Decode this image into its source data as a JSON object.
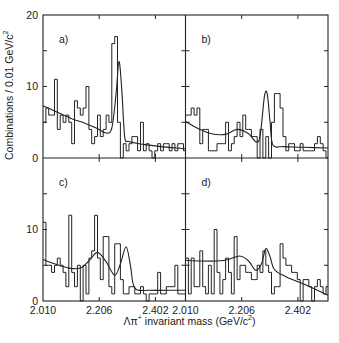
{
  "chart_data": {
    "type": "bar",
    "layout": "2x2 grid of histograms with fitted curves",
    "xlabel": "Λπ+ invariant mass (GeV/c²)",
    "ylabel": "Combinations / 0.01 GeV/c²",
    "x_range": [
      2.01,
      2.507
    ],
    "bin_width": 0.01,
    "x_ticks": [
      "2.010",
      "2.206",
      "2.402"
    ],
    "y_ticks_top": [
      "0",
      "10",
      "20"
    ],
    "y_ticks_bottom": [
      "0",
      "10"
    ],
    "ylim": [
      0,
      20
    ],
    "grid": false,
    "panels": [
      {
        "label": "a)",
        "bin_start": 2.01,
        "values": [
          5,
          7,
          6,
          6,
          11,
          4,
          6,
          5,
          6,
          5,
          2,
          8,
          7,
          6,
          7,
          10,
          4,
          2,
          3,
          6,
          3,
          4,
          6,
          5,
          16,
          17,
          5,
          0,
          2,
          1,
          2,
          3,
          3,
          1,
          5,
          1,
          2,
          1,
          0,
          1,
          2,
          1,
          2,
          2,
          1,
          2,
          1,
          2,
          2,
          1
        ],
        "fit": [
          [
            2.01,
            7.3
          ],
          [
            2.06,
            6.4
          ],
          [
            2.11,
            5.5
          ],
          [
            2.16,
            4.8
          ],
          [
            2.2,
            4.1
          ],
          [
            2.23,
            3.5
          ],
          [
            2.25,
            4.2
          ],
          [
            2.265,
            9.0
          ],
          [
            2.275,
            13.5
          ],
          [
            2.285,
            9.5
          ],
          [
            2.295,
            3.0
          ],
          [
            2.31,
            2.3
          ],
          [
            2.36,
            1.9
          ],
          [
            2.42,
            1.6
          ],
          [
            2.507,
            1.3
          ]
        ]
      },
      {
        "label": "b)",
        "bin_start": 2.01,
        "values": [
          6,
          6,
          7,
          6,
          7,
          2,
          4,
          4,
          1,
          1,
          1,
          2,
          2,
          2,
          5,
          1,
          2,
          3,
          5,
          3,
          6,
          4,
          4,
          3,
          3,
          0,
          4,
          0,
          3,
          0,
          5,
          9,
          9,
          7,
          3,
          1,
          2,
          2,
          1,
          1,
          2,
          1,
          1,
          1,
          1,
          2,
          3,
          2,
          1,
          0
        ],
        "fit": [
          [
            2.01,
            5.1
          ],
          [
            2.05,
            4.2
          ],
          [
            2.1,
            3.4
          ],
          [
            2.15,
            3.3
          ],
          [
            2.19,
            4.0
          ],
          [
            2.23,
            3.4
          ],
          [
            2.255,
            2.3
          ],
          [
            2.27,
            3.0
          ],
          [
            2.285,
            8.5
          ],
          [
            2.295,
            9.0
          ],
          [
            2.305,
            5.0
          ],
          [
            2.315,
            1.8
          ],
          [
            2.35,
            1.6
          ],
          [
            2.42,
            1.5
          ],
          [
            2.507,
            1.4
          ]
        ]
      },
      {
        "label": "c)",
        "bin_start": 2.01,
        "values": [
          11,
          5,
          5,
          4,
          5,
          6,
          5,
          4,
          2,
          12,
          4,
          2,
          5,
          0,
          5,
          1,
          6,
          7,
          12,
          6,
          3,
          9,
          9,
          2,
          1,
          8,
          8,
          3,
          1,
          1,
          2,
          2,
          1,
          1,
          2,
          1,
          0,
          1,
          1,
          1,
          4,
          1,
          1,
          2,
          2,
          2,
          5,
          1,
          1,
          1
        ],
        "fit": [
          [
            2.01,
            5.8
          ],
          [
            2.05,
            5.2
          ],
          [
            2.1,
            4.6
          ],
          [
            2.14,
            4.6
          ],
          [
            2.17,
            5.6
          ],
          [
            2.2,
            6.8
          ],
          [
            2.23,
            5.5
          ],
          [
            2.26,
            3.6
          ],
          [
            2.28,
            5.2
          ],
          [
            2.3,
            7.6
          ],
          [
            2.315,
            5.0
          ],
          [
            2.33,
            1.8
          ],
          [
            2.38,
            1.5
          ],
          [
            2.44,
            1.5
          ],
          [
            2.507,
            1.5
          ]
        ]
      },
      {
        "label": "d)",
        "bin_start": 2.01,
        "values": [
          6,
          1,
          6,
          2,
          2,
          7,
          2,
          1,
          5,
          1,
          10,
          4,
          1,
          3,
          6,
          4,
          1,
          9,
          3,
          5,
          5,
          4,
          4,
          3,
          3,
          5,
          4,
          7,
          5,
          4,
          1,
          2,
          2,
          8,
          6,
          5,
          5,
          4,
          4,
          3,
          0,
          3,
          3,
          2,
          0,
          2,
          3,
          2,
          1,
          2
        ],
        "fit": [
          [
            2.01,
            5.7
          ],
          [
            2.06,
            5.6
          ],
          [
            2.12,
            5.6
          ],
          [
            2.16,
            5.8
          ],
          [
            2.2,
            6.3
          ],
          [
            2.23,
            5.6
          ],
          [
            2.255,
            4.3
          ],
          [
            2.275,
            5.2
          ],
          [
            2.29,
            7.3
          ],
          [
            2.305,
            6.2
          ],
          [
            2.32,
            4.4
          ],
          [
            2.36,
            3.4
          ],
          [
            2.42,
            2.4
          ],
          [
            2.47,
            1.5
          ],
          [
            2.507,
            0.8
          ]
        ]
      }
    ]
  },
  "labels": {
    "y_axis": "Combinations / 0.01 GeV/c",
    "y_axis_sup": "2",
    "x_axis": "Λπ",
    "x_axis_sup": "+",
    "x_axis_rest": " invariant mass  (GeV/c",
    "x_axis_sup2": "2",
    "x_axis_end": ")"
  }
}
